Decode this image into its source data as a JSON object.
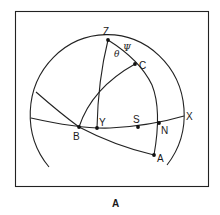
{
  "figure": {
    "caption": "A",
    "points": {
      "Z": "Z",
      "C": "C",
      "B": "B",
      "Y": "Y",
      "S": "S",
      "N": "N",
      "A": "A",
      "X": "X"
    },
    "angles": {
      "theta": "θ",
      "psi": "Ψ"
    }
  }
}
